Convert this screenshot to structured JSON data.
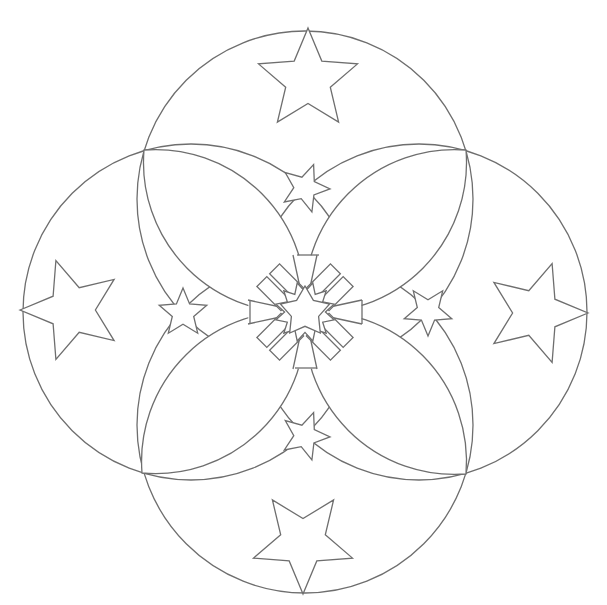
{
  "figure": {
    "title": "Mandala line art with stars",
    "stroke_color": "#6e6e6e",
    "background": "#ffffff",
    "center": [
      305,
      312
    ],
    "outer_circles": [
      {
        "name": "top",
        "cx": 305,
        "cy": 199,
        "r": 168
      },
      {
        "name": "bottom",
        "cx": 305,
        "cy": 425,
        "r": 168
      },
      {
        "name": "left",
        "cx": 191,
        "cy": 312,
        "r": 168
      },
      {
        "name": "right",
        "cx": 419,
        "cy": 312,
        "r": 168
      }
    ],
    "inner_circle_radius": 57,
    "large_stars": [
      {
        "position": "top",
        "cx": 308,
        "cy": 80,
        "r": 52,
        "rotation": 0
      },
      {
        "position": "bottom",
        "cx": 303,
        "cy": 542,
        "r": 52,
        "rotation": 180
      },
      {
        "position": "left",
        "cx": 72,
        "cy": 310,
        "r": 52,
        "rotation": -90
      },
      {
        "position": "right",
        "cx": 536,
        "cy": 313,
        "r": 52,
        "rotation": 90
      }
    ],
    "small_stars": [
      {
        "position": "top",
        "cx": 305,
        "cy": 188,
        "r": 25,
        "rotation": 20
      },
      {
        "position": "bottom",
        "cx": 305,
        "cy": 436,
        "r": 25,
        "rotation": 20
      },
      {
        "position": "left",
        "cx": 183,
        "cy": 313,
        "r": 25,
        "rotation": 0
      },
      {
        "position": "right",
        "cx": 428,
        "cy": 311,
        "r": 25,
        "rotation": 180
      }
    ],
    "petals": [
      "top-left",
      "top-right",
      "bottom-left",
      "bottom-right"
    ]
  }
}
